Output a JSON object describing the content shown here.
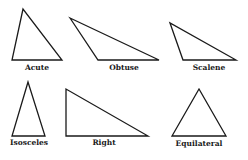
{
  "diagram": {
    "stroke_color": "#1a1a1a",
    "background": "#ffffff",
    "triangles": [
      {
        "label": "Acute",
        "points": "23,9 12,60 62,60",
        "label_x": 37,
        "label_y": 70
      },
      {
        "label": "Obtuse",
        "points": "70,18 98,60 159,60",
        "label_x": 124,
        "label_y": 70
      },
      {
        "label": "Scalene",
        "points": "170,23 183,60 236,60",
        "label_x": 209,
        "label_y": 70
      },
      {
        "label": "Isosceles",
        "points": "28,82 12,136 45,136",
        "label_x": 29,
        "label_y": 145
      },
      {
        "label": "Right",
        "points": "66,89 66,136 148,136",
        "label_x": 104,
        "label_y": 145
      },
      {
        "label": "Equilateral",
        "points": "199,89 172,136 226,136",
        "label_x": 199,
        "label_y": 146
      }
    ]
  }
}
